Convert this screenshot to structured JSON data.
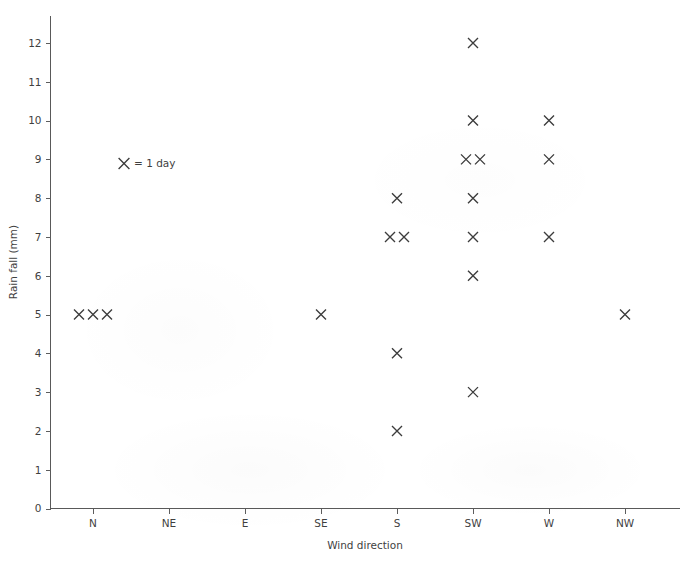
{
  "chart_data": {
    "type": "scatter",
    "title": "",
    "xlabel": "Wind direction",
    "ylabel": "Rain fall (mm)",
    "categories": [
      "N",
      "NE",
      "E",
      "SE",
      "S",
      "SW",
      "W",
      "NW"
    ],
    "yticks": [
      0,
      1,
      2,
      3,
      4,
      5,
      6,
      7,
      8,
      9,
      10,
      11,
      12
    ],
    "ylim": [
      0,
      12.6
    ],
    "grid": false,
    "legend": {
      "position": "inside-top-left",
      "marker": "x-cross",
      "text": "= 1 day",
      "full_text": "X = 1 day"
    },
    "marker_symbol": "x-cross",
    "marker_color": "#3c3c3c",
    "points": [
      {
        "category": "N",
        "value": 5,
        "count": 3
      },
      {
        "category": "NE",
        "value": 0,
        "count": 0
      },
      {
        "category": "E",
        "value": 0,
        "count": 0
      },
      {
        "category": "SE",
        "value": 5,
        "count": 1
      },
      {
        "category": "S",
        "value": 8,
        "count": 1
      },
      {
        "category": "S",
        "value": 7,
        "count": 2
      },
      {
        "category": "S",
        "value": 4,
        "count": 1
      },
      {
        "category": "S",
        "value": 2,
        "count": 1
      },
      {
        "category": "SW",
        "value": 12,
        "count": 1
      },
      {
        "category": "SW",
        "value": 10,
        "count": 1
      },
      {
        "category": "SW",
        "value": 9,
        "count": 2
      },
      {
        "category": "SW",
        "value": 8,
        "count": 1
      },
      {
        "category": "SW",
        "value": 7,
        "count": 1
      },
      {
        "category": "SW",
        "value": 6,
        "count": 1
      },
      {
        "category": "SW",
        "value": 3,
        "count": 1
      },
      {
        "category": "W",
        "value": 10,
        "count": 1
      },
      {
        "category": "W",
        "value": 9,
        "count": 1
      },
      {
        "category": "W",
        "value": 7,
        "count": 1
      },
      {
        "category": "NW",
        "value": 5,
        "count": 1
      }
    ],
    "counts_by_category": {
      "N": 3,
      "NE": 0,
      "E": 0,
      "SE": 1,
      "S": 5,
      "SW": 8,
      "W": 3,
      "NW": 1
    },
    "axis_color": "#595959",
    "text_color": "#3f3f3f"
  }
}
